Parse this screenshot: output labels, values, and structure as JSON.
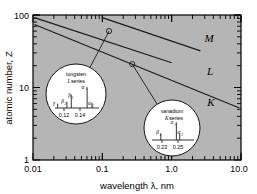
{
  "chart_data": {
    "type": "line",
    "title": "",
    "xlabel": "wavelength λ, nm",
    "ylabel": "atomic number, Z",
    "xscale": "log",
    "yscale": "log",
    "xlim": [
      0.01,
      10.0
    ],
    "ylim": [
      1,
      100
    ],
    "xticks": [
      "0.01",
      "0.1",
      "1.0",
      "10.0"
    ],
    "yticks": [
      "1",
      "10",
      "100"
    ],
    "grid": false,
    "legend": "inline-end-labels",
    "series": [
      {
        "name": "M",
        "label": "M",
        "points": [
          [
            0.1,
            92
          ],
          [
            2.6,
            32
          ]
        ],
        "comment": "M series shortest-wavelength line, upper right group"
      },
      {
        "name": "L",
        "label": "L",
        "points": [
          [
            0.0105,
            92
          ],
          [
            1.0,
            22
          ]
        ],
        "comment": "L series line, passes through tungsten marker"
      },
      {
        "name": "K",
        "label": "K",
        "points": [
          [
            0.0105,
            74
          ],
          [
            9.5,
            5.2
          ]
        ],
        "comment": "K series line, passes through vanadium marker"
      }
    ],
    "markers": [
      {
        "series": "L",
        "element": "tungsten",
        "x": 0.125,
        "y": 60
      },
      {
        "series": "K",
        "element": "vanadium",
        "x": 0.27,
        "y": 21
      }
    ]
  },
  "insets": [
    {
      "id": "tungsten-inset",
      "element": "tungsten",
      "series_label": "L",
      "series_word": "series",
      "axis_ticks": [
        "0.12",
        "0.14"
      ],
      "peaks": [
        {
          "label": "γ",
          "sub": "",
          "rel_x": 0.06,
          "height": 0.18
        },
        {
          "label": "β",
          "sub": "2",
          "rel_x": 0.27,
          "height": 0.26
        },
        {
          "label": "β",
          "sub": "1",
          "rel_x": 0.37,
          "height": 0.55
        },
        {
          "label": "α",
          "sub": "1",
          "rel_x": 0.73,
          "height": 0.86
        },
        {
          "label": "α",
          "sub": "2",
          "rel_x": 0.84,
          "height": 0.22
        }
      ]
    },
    {
      "id": "vanadium-inset",
      "element": "vanadium",
      "series_label": "K",
      "series_word": "series",
      "axis_ticks": [
        "0.23",
        "0.25"
      ],
      "peaks": [
        {
          "label": "β",
          "sub": "1",
          "rel_x": 0.21,
          "height": 0.3
        },
        {
          "label": "α",
          "sub": "1",
          "rel_x": 0.58,
          "height": 0.8
        },
        {
          "label": "α",
          "sub": "2",
          "rel_x": 0.66,
          "height": 0.3
        }
      ]
    }
  ],
  "colors": {
    "plot_background": "#b5b5b5",
    "page_background": "#ffffff",
    "axis": "#000000",
    "line": "#1a1a1a",
    "inset_fill": "#ffffff"
  },
  "axis": {
    "x_title": "wavelength λ, nm",
    "y_title": "atomic number, Z",
    "x_tick_0": "0.01",
    "x_tick_1": "0.1",
    "x_tick_2": "1.0",
    "x_tick_3": "10.0",
    "y_tick_0": "1",
    "y_tick_1": "10",
    "y_tick_2": "100"
  },
  "series_labels": {
    "m": "M",
    "l": "L",
    "k": "K"
  },
  "tungsten_inset": {
    "element": "tungsten",
    "series_letter": "L",
    "series_word": "series",
    "tick_low": "0.12",
    "tick_high": "0.14",
    "p_gamma": "γ",
    "p_beta": "β",
    "p_beta_sub2": "2",
    "p_beta1": "β",
    "p_beta_sub1": "1",
    "p_alpha1": "α",
    "p_alpha_sub1": "1",
    "p_alpha2": "α",
    "p_alpha_sub2": "2"
  },
  "vanadium_inset": {
    "element": "vanadium",
    "series_letter": "K",
    "series_word": "series",
    "tick_low": "0.23",
    "tick_high": "0.25",
    "p_beta1": "β",
    "p_beta_sub1": "1",
    "p_alpha1": "α",
    "p_alpha_sub1": "1",
    "p_alpha2": "α",
    "p_alpha_sub2": "2"
  }
}
